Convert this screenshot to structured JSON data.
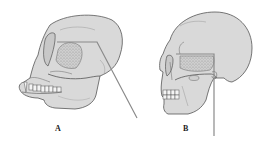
{
  "figure": {
    "panels": [
      {
        "id": "A",
        "label": "A",
        "subject": "ape skull (lateral view)"
      },
      {
        "id": "B",
        "label": "B",
        "subject": "human skull (lateral view)"
      }
    ]
  },
  "colors": {
    "background": "#ffffff",
    "bone_fill": "#d9d9d9",
    "outline": "#555555",
    "shading": "#9a9a9a",
    "pointer_line": "#8a8a8a",
    "label": "#222222"
  }
}
